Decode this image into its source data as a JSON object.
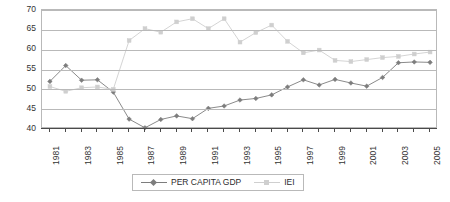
{
  "chart_data": {
    "type": "line",
    "title": "",
    "xlabel": "",
    "ylabel": "",
    "ylim": [
      40,
      70
    ],
    "yticks": [
      40,
      45,
      50,
      55,
      60,
      65,
      70
    ],
    "grid": true,
    "legend_position": "bottom-center",
    "x": [
      1981,
      1982,
      1983,
      1984,
      1985,
      1986,
      1987,
      1988,
      1989,
      1990,
      1991,
      1992,
      1993,
      1994,
      1995,
      1996,
      1997,
      1998,
      1999,
      2000,
      2001,
      2002,
      2003,
      2004,
      2005
    ],
    "xtick_labels": [
      "1981",
      "1983",
      "1985",
      "1987",
      "1989",
      "1991",
      "1993",
      "1995",
      "1997",
      "1999",
      "2001",
      "2003",
      "2005"
    ],
    "series": [
      {
        "name": "PER CAPITA GDP",
        "color": "#7d7d7d",
        "marker": "diamond",
        "values": [
          52.0,
          56.0,
          52.3,
          52.4,
          49.3,
          42.5,
          40.3,
          42.4,
          43.3,
          42.6,
          45.2,
          45.8,
          47.3,
          47.7,
          48.6,
          50.6,
          52.4,
          51.1,
          52.5,
          51.6,
          50.8,
          53.0,
          56.7,
          56.9,
          56.8
        ]
      },
      {
        "name": "IEI",
        "color": "#cfcfcf",
        "marker": "square",
        "values": [
          50.7,
          49.5,
          50.4,
          50.6,
          50.0,
          62.3,
          65.3,
          64.4,
          67.0,
          67.8,
          65.3,
          67.8,
          61.9,
          64.3,
          66.2,
          62.1,
          59.2,
          59.9,
          57.3,
          57.0,
          57.5,
          58.0,
          58.3,
          58.9,
          59.4
        ]
      }
    ]
  },
  "legend": {
    "items": [
      {
        "label": "PER CAPITA GDP"
      },
      {
        "label": "IEI"
      }
    ]
  }
}
